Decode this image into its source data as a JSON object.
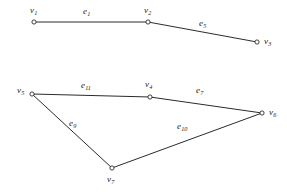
{
  "figure": {
    "width": 287,
    "height": 192,
    "background_color": "#ffffff",
    "stroke_color": "#2b2b2b",
    "text_color": "#1c1c1c"
  },
  "graphs": [
    {
      "name": "upper-path-graph",
      "vertices": [
        {
          "id": "v1",
          "base": "v",
          "sub": "1",
          "x": 34,
          "y": 22,
          "label_x": 30,
          "label_y": 6
        },
        {
          "id": "v2",
          "base": "v",
          "sub": "2",
          "x": 148,
          "y": 22,
          "label_x": 144,
          "label_y": 6
        },
        {
          "id": "v3",
          "base": "v",
          "sub": "3",
          "x": 257,
          "y": 42,
          "label_x": 264,
          "label_y": 37
        }
      ],
      "edges": [
        {
          "id": "e1",
          "base": "e",
          "sub": "1",
          "from": "v1",
          "to": "v2",
          "label_x": 83,
          "label_y": 7
        },
        {
          "id": "e5",
          "base": "e",
          "sub": "5",
          "from": "v2",
          "to": "v3",
          "label_x": 199,
          "label_y": 19
        }
      ]
    },
    {
      "name": "lower-cycle-graph",
      "vertices": [
        {
          "id": "v5",
          "base": "v",
          "sub": "5",
          "x": 32,
          "y": 94,
          "label_x": 17,
          "label_y": 86
        },
        {
          "id": "v4",
          "base": "v",
          "sub": "4",
          "x": 150,
          "y": 97,
          "label_x": 145,
          "label_y": 80
        },
        {
          "id": "v6",
          "base": "v",
          "sub": "6",
          "x": 262,
          "y": 113,
          "label_x": 269,
          "label_y": 108
        },
        {
          "id": "v7",
          "base": "v",
          "sub": "7",
          "x": 112,
          "y": 168,
          "label_x": 107,
          "label_y": 175
        }
      ],
      "edges": [
        {
          "id": "e11",
          "base": "e",
          "sub": "11",
          "from": "v5",
          "to": "v4",
          "label_x": 81,
          "label_y": 81
        },
        {
          "id": "e7",
          "base": "e",
          "sub": "7",
          "from": "v4",
          "to": "v6",
          "label_x": 196,
          "label_y": 86
        },
        {
          "id": "e9",
          "base": "e",
          "sub": "9",
          "from": "v5",
          "to": "v7",
          "label_x": 69,
          "label_y": 119
        },
        {
          "id": "e10",
          "base": "e",
          "sub": "10",
          "from": "v7",
          "to": "v6",
          "label_x": 177,
          "label_y": 122
        }
      ]
    }
  ]
}
